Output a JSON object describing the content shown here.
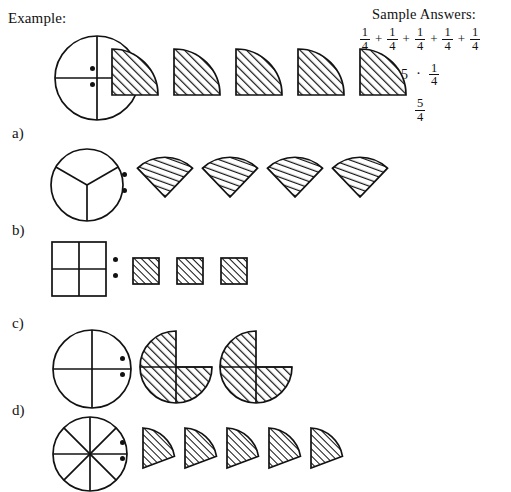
{
  "page": {
    "example_label": "Example:",
    "background_color": "#ffffff",
    "ink_color": "#121212"
  },
  "sample_answers": {
    "title": "Sample Answers:",
    "lines": [
      {
        "id": "repeated-addition",
        "parts": [
          {
            "type": "fraction",
            "num": "1",
            "den": "4"
          },
          {
            "type": "operator",
            "text": "+"
          },
          {
            "type": "fraction",
            "num": "1",
            "den": "4"
          },
          {
            "type": "operator",
            "text": "+"
          },
          {
            "type": "fraction",
            "num": "1",
            "den": "4"
          },
          {
            "type": "operator",
            "text": "+"
          },
          {
            "type": "fraction",
            "num": "1",
            "den": "4"
          },
          {
            "type": "operator",
            "text": "+"
          },
          {
            "type": "fraction",
            "num": "1",
            "den": "4"
          }
        ]
      },
      {
        "id": "multiplication",
        "parts": [
          {
            "type": "scalar",
            "text": "5"
          },
          {
            "type": "dot",
            "text": "·"
          },
          {
            "type": "fraction",
            "num": "1",
            "den": "4"
          }
        ]
      },
      {
        "id": "improper-fraction",
        "parts": [
          {
            "type": "fraction",
            "num": "5",
            "den": "4"
          }
        ]
      }
    ]
  },
  "rows": [
    {
      "id": "example",
      "label": "Example:",
      "whole": {
        "shape": "circle",
        "divisions": 4,
        "division_style": "cross"
      },
      "separator": ":",
      "pieces": {
        "shape": "quarter-circle-wedge",
        "count": 5,
        "fill": "hatched"
      }
    },
    {
      "id": "a",
      "label": "a)",
      "whole": {
        "shape": "circle",
        "divisions": 3,
        "division_style": "y-spokes"
      },
      "separator": ":",
      "pieces": {
        "shape": "third-circle-sector",
        "count": 4,
        "fill": "hatched"
      }
    },
    {
      "id": "b",
      "label": "b)",
      "whole": {
        "shape": "square",
        "divisions": 4,
        "division_style": "quadrants"
      },
      "separator": ":",
      "pieces": {
        "shape": "square",
        "count": 3,
        "fill": "hatched"
      }
    },
    {
      "id": "c",
      "label": "c)",
      "whole": {
        "shape": "circle",
        "divisions": 4,
        "division_style": "cross"
      },
      "separator": ":",
      "pieces": {
        "shape": "three-quarter-circle",
        "count": 2,
        "fill": "hatched"
      }
    },
    {
      "id": "d",
      "label": "d)",
      "whole": {
        "shape": "circle",
        "divisions": 8,
        "division_style": "eight-spokes"
      },
      "separator": ":",
      "pieces": {
        "shape": "eighth-circle-wedge",
        "count": 5,
        "fill": "hatched"
      }
    }
  ]
}
